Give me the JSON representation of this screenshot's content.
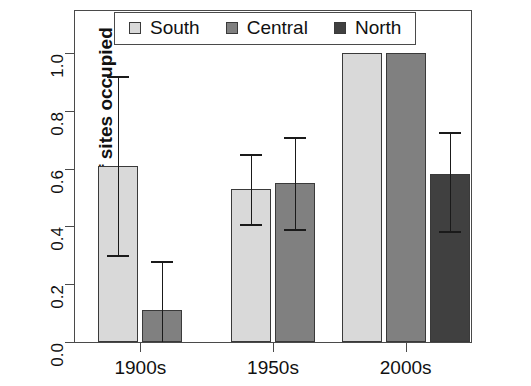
{
  "chart_data": {
    "type": "bar",
    "title": "",
    "subtitle": "",
    "xlabel": "",
    "ylabel": "Proportion of sites occupied",
    "categories": [
      "1900s",
      "1950s",
      "2000s"
    ],
    "ylim": [
      0.0,
      1.0
    ],
    "ytick_labels": [
      "0.0",
      "0.2",
      "0.4",
      "0.6",
      "0.8",
      "1.0"
    ],
    "ytick_values": [
      0.0,
      0.2,
      0.4,
      0.6,
      0.8,
      1.0
    ],
    "grid": false,
    "legend_position": "top",
    "error_bars": "asymmetric whiskers with caps",
    "series": [
      {
        "name": "South",
        "color": "#d9d9d9",
        "values": [
          0.61,
          0.53,
          1.0
        ],
        "err_low": [
          0.3,
          0.41,
          null
        ],
        "err_high": [
          0.92,
          0.65,
          null
        ]
      },
      {
        "name": "Central",
        "color": "#808080",
        "values": [
          0.11,
          0.55,
          1.0
        ],
        "err_low": [
          null,
          0.39,
          null
        ],
        "err_high": [
          0.28,
          0.71,
          null
        ]
      },
      {
        "name": "North",
        "color": "#404040",
        "values": [
          null,
          null,
          0.58
        ],
        "err_low": [
          null,
          null,
          0.385
        ],
        "err_high": [
          null,
          null,
          0.725
        ]
      }
    ]
  },
  "legend": {
    "items": [
      {
        "label": "South",
        "color": "#d9d9d9"
      },
      {
        "label": "Central",
        "color": "#808080"
      },
      {
        "label": "North",
        "color": "#404040"
      }
    ]
  },
  "caption": {
    "text": ""
  }
}
